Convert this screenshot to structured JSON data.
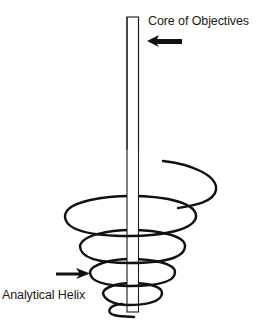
{
  "diagram": {
    "labels": {
      "core": "Core of Objectives",
      "helix": "Analytical Helix"
    },
    "elements": {
      "core_column": {
        "shape": "vertical-rectangle",
        "stroke": "#1a1a1a",
        "fill": "#ffffff"
      },
      "helix": {
        "shape": "spiral",
        "turns": 5,
        "direction": "narrowing-downward",
        "stroke": "#111111"
      },
      "core_arrow": {
        "points_to": "core",
        "direction": "left"
      },
      "helix_arrow": {
        "points_to": "helix",
        "direction": "right"
      }
    }
  }
}
